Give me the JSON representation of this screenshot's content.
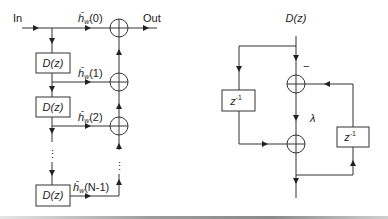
{
  "left_diagram": {
    "input_label": "In",
    "output_label": "Out",
    "delay_blocks": [
      "D(z)",
      "D(z)",
      "D(z)"
    ],
    "tap_labels": [
      {
        "base": "ĥ",
        "sub": "w",
        "arg": "(0)"
      },
      {
        "base": "ĥ",
        "sub": "w",
        "arg": "(1)"
      },
      {
        "base": "ĥ",
        "sub": "w",
        "arg": "(2)"
      },
      {
        "base": "ĥ",
        "sub": "w",
        "arg": "(N-1)"
      }
    ],
    "ellipsis": "⋮"
  },
  "right_diagram": {
    "input_label": "D(z)",
    "delay_blocks": [
      {
        "base": "z",
        "sup": "-1"
      },
      {
        "base": "z",
        "sup": "-1"
      }
    ],
    "minus_sign": "−",
    "gain_label": "λ"
  }
}
